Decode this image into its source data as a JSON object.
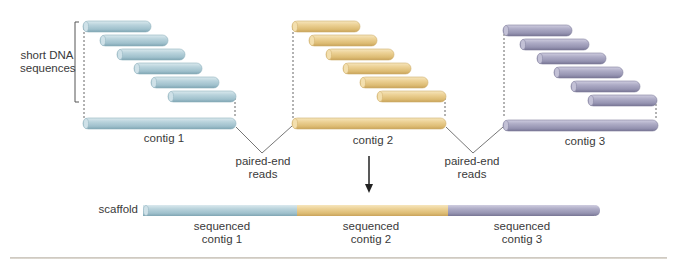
{
  "figure": {
    "title": "",
    "colors": {
      "contig1": "#a9c9d4",
      "contig2": "#e6c987",
      "contig3": "#9c9ab5",
      "line": "#555555"
    },
    "labels": {
      "short_dna_line1": "short DNA",
      "short_dna_line2": "sequences",
      "contig1": "contig 1",
      "contig2": "contig 2",
      "contig3": "contig 3",
      "paired_end_1_line1": "paired-end",
      "paired_end_1_line2": "reads",
      "paired_end_2_line1": "paired-end",
      "paired_end_2_line2": "reads",
      "scaffold": "scaffold",
      "seq_contig1_line1": "sequenced",
      "seq_contig1_line2": "contig 1",
      "seq_contig2_line1": "sequenced",
      "seq_contig2_line2": "contig 2",
      "seq_contig3_line1": "sequenced",
      "seq_contig3_line2": "contig 3"
    },
    "groups": [
      {
        "name": "contig 1",
        "x0": 83,
        "color": "contig1",
        "reads": 6,
        "contig_width": 153
      },
      {
        "name": "contig 2",
        "x0": 292,
        "color": "contig2",
        "reads": 6,
        "contig_width": 154
      },
      {
        "name": "contig 3",
        "x0": 503,
        "color": "contig3",
        "reads": 6,
        "contig_width": 155
      }
    ],
    "scaffold": {
      "x": 143,
      "y": 205,
      "height": 11,
      "segments": [
        {
          "label": "sequenced contig 1",
          "from": 143,
          "to": 297,
          "color": "contig1"
        },
        {
          "label": "sequenced contig 2",
          "from": 297,
          "to": 448,
          "color": "contig2"
        },
        {
          "label": "sequenced contig 3",
          "from": 448,
          "to": 600,
          "color": "contig3"
        }
      ]
    }
  }
}
